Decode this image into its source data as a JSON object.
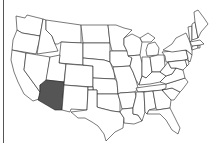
{
  "map": {
    "title": "United States",
    "highlighted_state": "Arizona",
    "highlight_color": "#555555",
    "base_color": "#ffffff",
    "border_color": "#222222",
    "states": [
      "Washington",
      "Oregon",
      "California",
      "Idaho",
      "Nevada",
      "Montana",
      "Wyoming",
      "Utah",
      "Arizona",
      "Colorado",
      "New Mexico",
      "North Dakota",
      "South Dakota",
      "Nebraska",
      "Kansas",
      "Oklahoma",
      "Texas",
      "Minnesota",
      "Iowa",
      "Missouri",
      "Arkansas",
      "Louisiana",
      "Wisconsin",
      "Illinois",
      "Michigan",
      "Indiana",
      "Ohio",
      "Kentucky",
      "Tennessee",
      "Mississippi",
      "Alabama",
      "Georgia",
      "Florida",
      "South Carolina",
      "North Carolina",
      "Virginia",
      "West Virginia",
      "Pennsylvania",
      "New York",
      "Maryland",
      "Delaware",
      "New Jersey",
      "Connecticut",
      "Rhode Island",
      "Massachusetts",
      "Vermont",
      "New Hampshire",
      "Maine"
    ]
  }
}
